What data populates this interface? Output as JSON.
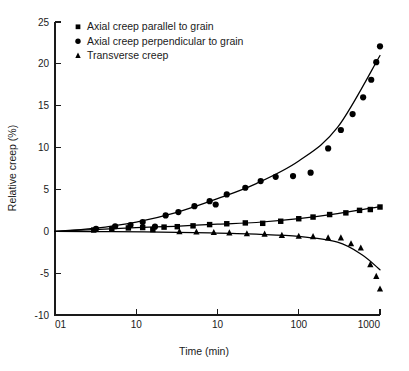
{
  "chart_data": {
    "type": "scatter",
    "title": "",
    "xlabel": "Time (min)",
    "ylabel": "Relative creep (%)",
    "xscale": "log",
    "xtick_labels": [
      "01",
      "10",
      "10",
      "100",
      "1000"
    ],
    "xtick_values": [
      0.1,
      1,
      10,
      100,
      1000
    ],
    "xlim": [
      0.1,
      1000
    ],
    "ytick_labels": [
      "25",
      "20",
      "15",
      "10",
      "5",
      "0",
      "-5",
      "-10"
    ],
    "ytick_values": [
      25,
      20,
      15,
      10,
      5,
      0,
      -5,
      -10
    ],
    "ylim": [
      -10,
      25
    ],
    "grid": false,
    "legend_position": "top-left",
    "series": [
      {
        "name": "Axial creep parallel to grain",
        "marker": "square",
        "color": "#000000",
        "points": [
          {
            "x": 0.3,
            "y": 0.15
          },
          {
            "x": 0.5,
            "y": 0.3
          },
          {
            "x": 0.8,
            "y": 0.4
          },
          {
            "x": 1.2,
            "y": 0.45
          },
          {
            "x": 1.6,
            "y": 0.2
          },
          {
            "x": 2.2,
            "y": 0.5
          },
          {
            "x": 3.2,
            "y": 0.55
          },
          {
            "x": 5.0,
            "y": 0.65
          },
          {
            "x": 8.0,
            "y": 0.8
          },
          {
            "x": 13.0,
            "y": 0.9
          },
          {
            "x": 22.0,
            "y": 1.0
          },
          {
            "x": 36.0,
            "y": 0.95
          },
          {
            "x": 60.0,
            "y": 1.2
          },
          {
            "x": 100.0,
            "y": 1.5
          },
          {
            "x": 150.0,
            "y": 1.7
          },
          {
            "x": 240.0,
            "y": 2.0
          },
          {
            "x": 380.0,
            "y": 2.2
          },
          {
            "x": 560.0,
            "y": 2.5
          },
          {
            "x": 760.0,
            "y": 2.6
          },
          {
            "x": 1000.0,
            "y": 2.9
          }
        ],
        "fit": [
          {
            "x": 0.1,
            "y": 0.0
          },
          {
            "x": 0.3,
            "y": 0.2
          },
          {
            "x": 1.0,
            "y": 0.45
          },
          {
            "x": 3.0,
            "y": 0.6
          },
          {
            "x": 10.0,
            "y": 0.85
          },
          {
            "x": 30.0,
            "y": 1.05
          },
          {
            "x": 100.0,
            "y": 1.5
          },
          {
            "x": 300.0,
            "y": 2.1
          },
          {
            "x": 1000.0,
            "y": 2.95
          }
        ]
      },
      {
        "name": "Axial creep perpendicular to grain",
        "marker": "circle",
        "color": "#000000",
        "points": [
          {
            "x": 0.32,
            "y": 0.3
          },
          {
            "x": 0.55,
            "y": 0.6
          },
          {
            "x": 0.85,
            "y": 0.75
          },
          {
            "x": 1.2,
            "y": 1.1
          },
          {
            "x": 1.7,
            "y": 0.55
          },
          {
            "x": 2.3,
            "y": 1.9
          },
          {
            "x": 3.3,
            "y": 2.3
          },
          {
            "x": 5.2,
            "y": 3.0
          },
          {
            "x": 8.0,
            "y": 3.6
          },
          {
            "x": 9.5,
            "y": 3.2
          },
          {
            "x": 13.0,
            "y": 4.4
          },
          {
            "x": 22.0,
            "y": 5.2
          },
          {
            "x": 34.0,
            "y": 6.0
          },
          {
            "x": 52.0,
            "y": 6.5
          },
          {
            "x": 85.0,
            "y": 6.6
          },
          {
            "x": 140.0,
            "y": 7.0
          },
          {
            "x": 230.0,
            "y": 9.9
          },
          {
            "x": 330.0,
            "y": 12.1
          },
          {
            "x": 460.0,
            "y": 14.0
          },
          {
            "x": 620.0,
            "y": 16.0
          },
          {
            "x": 780.0,
            "y": 18.1
          },
          {
            "x": 900.0,
            "y": 20.2
          },
          {
            "x": 1000.0,
            "y": 22.1
          }
        ],
        "fit": [
          {
            "x": 0.1,
            "y": 0.0
          },
          {
            "x": 0.3,
            "y": 0.35
          },
          {
            "x": 1.0,
            "y": 1.1
          },
          {
            "x": 3.0,
            "y": 2.2
          },
          {
            "x": 10.0,
            "y": 3.9
          },
          {
            "x": 30.0,
            "y": 5.7
          },
          {
            "x": 100.0,
            "y": 8.4
          },
          {
            "x": 300.0,
            "y": 12.4
          },
          {
            "x": 1000.0,
            "y": 21.0
          }
        ]
      },
      {
        "name": "Transverse creep",
        "marker": "triangle",
        "color": "#000000",
        "points": [
          {
            "x": 3.4,
            "y": -0.05
          },
          {
            "x": 5.5,
            "y": -0.1
          },
          {
            "x": 9.0,
            "y": -0.15
          },
          {
            "x": 14.0,
            "y": -0.2
          },
          {
            "x": 23.0,
            "y": -0.3
          },
          {
            "x": 38.0,
            "y": -0.35
          },
          {
            "x": 62.0,
            "y": -0.5
          },
          {
            "x": 100.0,
            "y": -0.6
          },
          {
            "x": 150.0,
            "y": -0.65
          },
          {
            "x": 230.0,
            "y": -0.8
          },
          {
            "x": 330.0,
            "y": -0.8
          },
          {
            "x": 440.0,
            "y": -1.5
          },
          {
            "x": 580.0,
            "y": -2.0
          },
          {
            "x": 760.0,
            "y": -4.0
          },
          {
            "x": 900.0,
            "y": -5.4
          },
          {
            "x": 1000.0,
            "y": -6.9
          }
        ],
        "fit": [
          {
            "x": 0.1,
            "y": 0.0
          },
          {
            "x": 0.5,
            "y": -0.05
          },
          {
            "x": 2.0,
            "y": -0.1
          },
          {
            "x": 8.0,
            "y": -0.2
          },
          {
            "x": 30.0,
            "y": -0.35
          },
          {
            "x": 100.0,
            "y": -0.6
          },
          {
            "x": 300.0,
            "y": -1.3
          },
          {
            "x": 600.0,
            "y": -2.8
          },
          {
            "x": 1000.0,
            "y": -4.6
          }
        ]
      }
    ]
  },
  "axes": {
    "x_title": "Time (min)",
    "y_title": "Relative creep (%)"
  },
  "legend": {
    "items": [
      {
        "label": "Axial creep parallel to grain",
        "marker": "square"
      },
      {
        "label": "Axial creep perpendicular to grain",
        "marker": "circle"
      },
      {
        "label": "Transverse creep",
        "marker": "triangle"
      }
    ]
  }
}
